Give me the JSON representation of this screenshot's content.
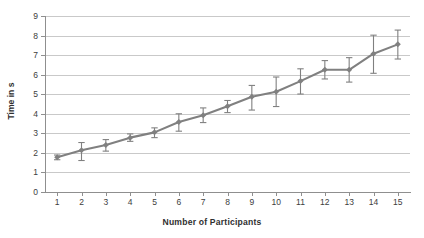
{
  "chart_data": {
    "type": "line",
    "title": "",
    "subtitle": "",
    "xlabel": "Number of Participants",
    "ylabel": "Time in s",
    "x": [
      1,
      2,
      3,
      4,
      5,
      6,
      7,
      8,
      9,
      10,
      11,
      12,
      13,
      14,
      15
    ],
    "categories": [
      "1",
      "2",
      "3",
      "4",
      "5",
      "6",
      "7",
      "8",
      "9",
      "10",
      "11",
      "12",
      "13",
      "14",
      "15"
    ],
    "values": [
      1.78,
      2.13,
      2.4,
      2.78,
      3.05,
      3.58,
      3.93,
      4.38,
      4.87,
      5.13,
      5.67,
      6.25,
      6.25,
      7.07,
      7.55
    ],
    "series": [
      {
        "name": "Time in s",
        "values": [
          1.78,
          2.13,
          2.4,
          2.78,
          3.05,
          3.58,
          3.93,
          4.38,
          4.87,
          5.13,
          5.67,
          6.25,
          6.25,
          7.07,
          7.55
        ],
        "error_low": [
          0.13,
          0.52,
          0.31,
          0.19,
          0.27,
          0.47,
          0.38,
          0.32,
          0.68,
          0.76,
          0.66,
          0.47,
          0.63,
          1.0,
          0.75
        ],
        "error_high": [
          0.11,
          0.4,
          0.28,
          0.19,
          0.23,
          0.42,
          0.37,
          0.3,
          0.58,
          0.75,
          0.63,
          0.47,
          0.62,
          0.95,
          0.73
        ],
        "color": "#808080",
        "marker": "diamond"
      }
    ],
    "xlim": [
      0.5,
      15.5
    ],
    "ylim": [
      0,
      9
    ],
    "ytick_labels": [
      "0",
      "1",
      "2",
      "3",
      "4",
      "5",
      "6",
      "7",
      "8",
      "9"
    ],
    "ytick_values": [
      0,
      1,
      2,
      3,
      4,
      5,
      6,
      7,
      8,
      9
    ],
    "grid": true,
    "grid_axis": "y",
    "legend": false,
    "legend_position": "none",
    "colors": {
      "series": "#808080",
      "gridline": "#c9c9c9",
      "axis": "#8f8f8f",
      "text": "#3d3d3d",
      "background": "#ffffff"
    }
  }
}
